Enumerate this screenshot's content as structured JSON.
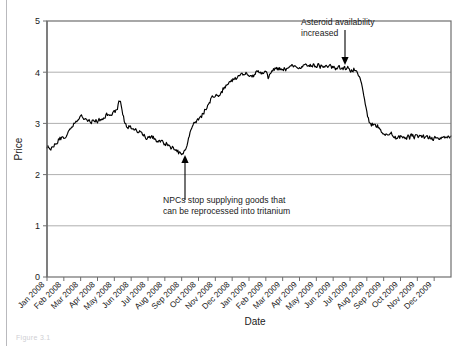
{
  "figure": {
    "caption": "Figure 3.1",
    "background": "#ffffff",
    "line_color": "#000000",
    "grid_color": "#9a9a9a",
    "frame_color": "#6e6e6e"
  },
  "chart_data": {
    "type": "line",
    "title": "",
    "xlabel": "Date",
    "ylabel": "Price",
    "ylim": [
      0,
      5
    ],
    "yticks": [
      0,
      1,
      2,
      3,
      4,
      5
    ],
    "ytick_labels": [
      "0",
      "1",
      "2",
      "3",
      "4",
      "5"
    ],
    "grid": true,
    "grid_axis": "y",
    "legend": false,
    "xtick_rotation": 45,
    "categories": [
      "Jan 2008",
      "Feb 2008",
      "Mar 2008",
      "Apr 2008",
      "May 2008",
      "Jun 2008",
      "Jul 2008",
      "Aug 2008",
      "Sep 2008",
      "Oct 2008",
      "Nov 2008",
      "Dec 2008",
      "Jan 2009",
      "Feb 2009",
      "Mar 2009",
      "Apr 2009",
      "May 2009",
      "Jun 2009",
      "Jul 2009",
      "Aug 2009",
      "Sep 2009",
      "Oct 2009",
      "Nov 2009",
      "Dec 2009"
    ],
    "series": [
      {
        "name": "Price",
        "monthly_values": [
          2.52,
          2.72,
          3.12,
          3.05,
          3.22,
          2.92,
          2.75,
          2.6,
          2.42,
          3.1,
          3.55,
          3.85,
          3.95,
          4.02,
          4.08,
          4.12,
          4.14,
          4.1,
          4.06,
          3.3,
          2.82,
          2.74,
          2.76,
          2.72
        ],
        "notes": "Noisy daily price series; starts near 2.5, peaks near 3.35 in May 2008, troughs near 2.4 in Sep 2008, rises to a ~4.1 plateau through mid-2009, then drops sharply to ~2.75."
      }
    ],
    "annotations": [
      {
        "id": "npc-annotation",
        "text_lines": [
          "NPCs stop supplying goods that",
          "can be reprocessed into tritanium"
        ],
        "arrow": "up",
        "points_to_category": "Sep 2008",
        "points_to_value": 2.42
      },
      {
        "id": "asteroid-annotation",
        "text_lines": [
          "Asteroid availability",
          "increased"
        ],
        "arrow": "down",
        "points_to_category": "Jul 2009",
        "points_to_value": 4.06
      }
    ]
  }
}
